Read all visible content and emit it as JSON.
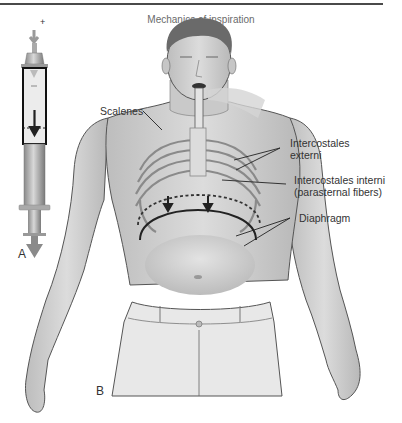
{
  "figure": {
    "title": "Mechanics of inspiration",
    "panels": [
      {
        "id": "A",
        "label": "A",
        "subject": "syringe-model"
      },
      {
        "id": "B",
        "label": "B",
        "subject": "human-torso"
      }
    ],
    "labels": {
      "scalenes": "Scalenes",
      "intercostales_externi_1": "Intercostales",
      "intercostales_externi_2": "externi",
      "intercostales_interni_1": "Intercostales interni",
      "intercostales_interni_2": "(parasternal fibers)",
      "diaphragm": "Diaphragm"
    },
    "syringe_plus_sign": "+",
    "colors": {
      "rule": "#4a4a4a",
      "skin": "#d2d2d2",
      "skin_shadow": "#a9a9a9",
      "outline": "#5a5a5a",
      "text": "#333333"
    }
  }
}
